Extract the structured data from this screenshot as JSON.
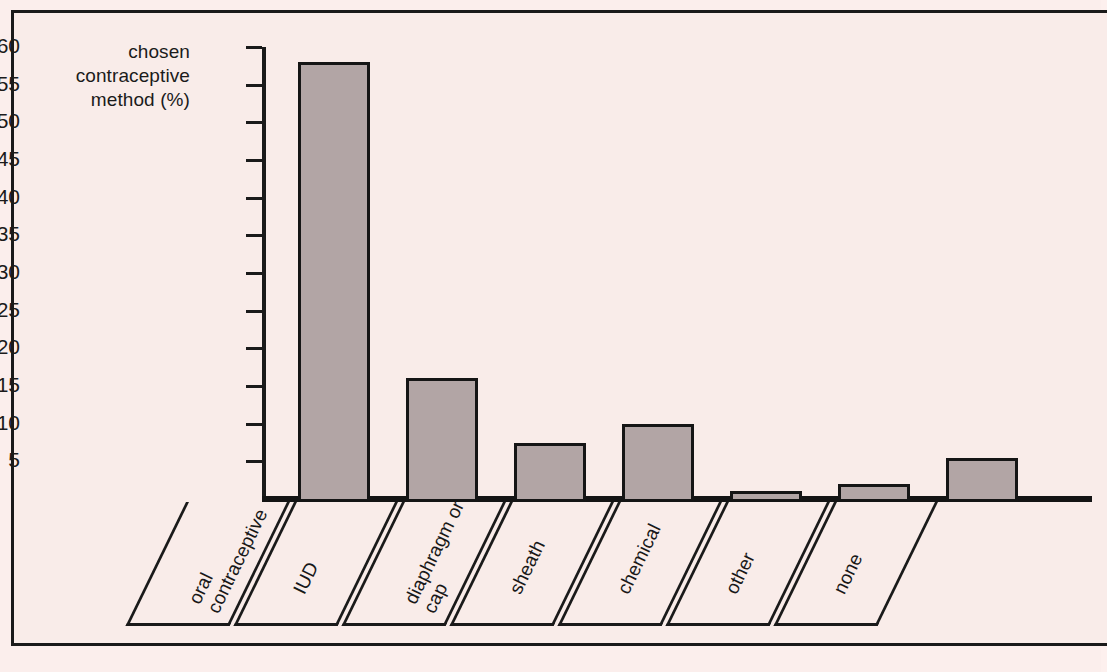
{
  "chart_data": {
    "type": "bar",
    "title": "",
    "subtitle": "",
    "xlabel": "",
    "ylabel": "chosen contraceptive method (%)",
    "ylabel_lines": [
      "chosen",
      "contraceptive",
      "method (%)"
    ],
    "categories": [
      "oral contraceptive",
      "IUD",
      "diaphragm or cap",
      "sheath",
      "chemical",
      "other",
      "none"
    ],
    "category_lines": [
      [
        "oral",
        "contraceptive"
      ],
      [
        "IUD"
      ],
      [
        "diaphragm or",
        "cap"
      ],
      [
        "sheath"
      ],
      [
        "chemical"
      ],
      [
        "other"
      ],
      [
        "none"
      ]
    ],
    "values": [
      58,
      16,
      7.5,
      10,
      1,
      2,
      5.5
    ],
    "ylim": [
      0,
      60
    ],
    "ytick_values": [
      60,
      55,
      50,
      45,
      40,
      35,
      30,
      25,
      20,
      15,
      10,
      5
    ],
    "ytick_labels": [
      "60",
      "55",
      "50",
      "45",
      "40",
      "35",
      "30",
      "25",
      "20",
      "15",
      "10",
      "5"
    ],
    "grid": false,
    "legend": null,
    "legend_position": "none",
    "annotations": []
  },
  "style": {
    "page_background": "#fbeeec",
    "panel_background": "#f9ece9",
    "bar_fill": "#b2a5a5",
    "ink": "#1a1a1a",
    "frame_border": "#1a1a1a"
  }
}
